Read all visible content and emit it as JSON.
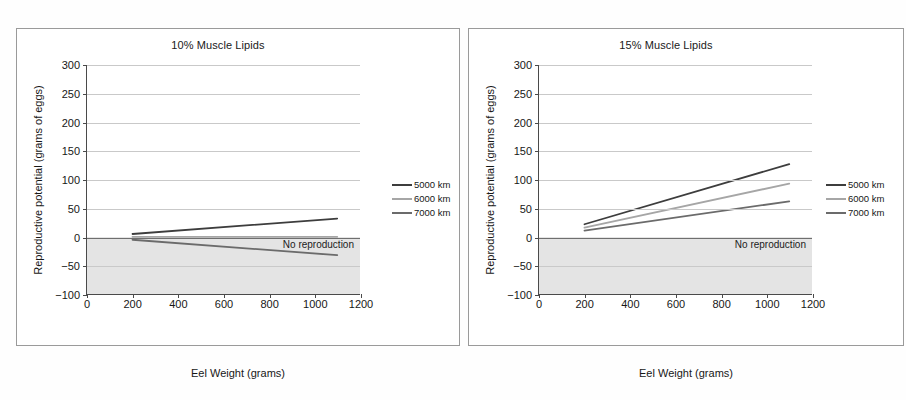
{
  "chart_data": [
    {
      "type": "line",
      "title": "10% Muscle Lipids",
      "xlabel": "Eel Weight (grams)",
      "ylabel": "Reproductive potential (grams of eggs)",
      "xlim": [
        0,
        1200
      ],
      "ylim": [
        -100,
        300
      ],
      "xticks": [
        0,
        200,
        400,
        600,
        800,
        1000,
        1200
      ],
      "yticks": [
        -100,
        -50,
        0,
        50,
        100,
        150,
        200,
        250,
        300
      ],
      "grid": true,
      "legend_position": "right-outside",
      "annotations": [
        {
          "text": "No reproduction",
          "region": "y < 0",
          "shaded": true
        }
      ],
      "series": [
        {
          "name": "5000 km",
          "color": "#3d3d3d",
          "x": [
            200,
            1100
          ],
          "values": [
            5,
            32
          ]
        },
        {
          "name": "6000 km",
          "color": "#a6a6a6",
          "x": [
            200,
            1100
          ],
          "values": [
            0,
            0
          ]
        },
        {
          "name": "7000 km",
          "color": "#6b6b6b",
          "x": [
            200,
            1100
          ],
          "values": [
            -5,
            -32
          ]
        }
      ]
    },
    {
      "type": "line",
      "title": "15% Muscle Lipids",
      "xlabel": "Eel Weight (grams)",
      "ylabel": "Reproductive potential (grams of eggs)",
      "xlim": [
        0,
        1200
      ],
      "ylim": [
        -100,
        300
      ],
      "xticks": [
        0,
        200,
        400,
        600,
        800,
        1000,
        1200
      ],
      "yticks": [
        -100,
        -50,
        0,
        50,
        100,
        150,
        200,
        250,
        300
      ],
      "grid": true,
      "legend_position": "right-outside",
      "annotations": [
        {
          "text": "No reproduction",
          "region": "y < 0",
          "shaded": true
        }
      ],
      "series": [
        {
          "name": "5000 km",
          "color": "#3d3d3d",
          "x": [
            200,
            1100
          ],
          "values": [
            22,
            127
          ]
        },
        {
          "name": "6000 km",
          "color": "#a6a6a6",
          "x": [
            200,
            1100
          ],
          "values": [
            16,
            93
          ]
        },
        {
          "name": "7000 km",
          "color": "#6b6b6b",
          "x": [
            200,
            1100
          ],
          "values": [
            11,
            62
          ]
        }
      ]
    }
  ],
  "panels": [
    {
      "id": "left",
      "title": "10% Muscle Lipids",
      "xlabel": "Eel Weight (grams)",
      "ylabel": "Reproductive potential (grams of eggs)",
      "shaded_label": "No reproduction",
      "legend": [
        {
          "label": "5000 km",
          "color": "#3d3d3d"
        },
        {
          "label": "6000 km",
          "color": "#a6a6a6"
        },
        {
          "label": "7000 km",
          "color": "#6b6b6b"
        }
      ]
    },
    {
      "id": "right",
      "title": "15% Muscle Lipids",
      "xlabel": "Eel Weight (grams)",
      "ylabel": "Reproductive potential (grams of eggs)",
      "shaded_label": "No reproduction",
      "legend": [
        {
          "label": "5000 km",
          "color": "#3d3d3d"
        },
        {
          "label": "6000 km",
          "color": "#a6a6a6"
        },
        {
          "label": "7000 km",
          "color": "#6b6b6b"
        }
      ]
    }
  ]
}
